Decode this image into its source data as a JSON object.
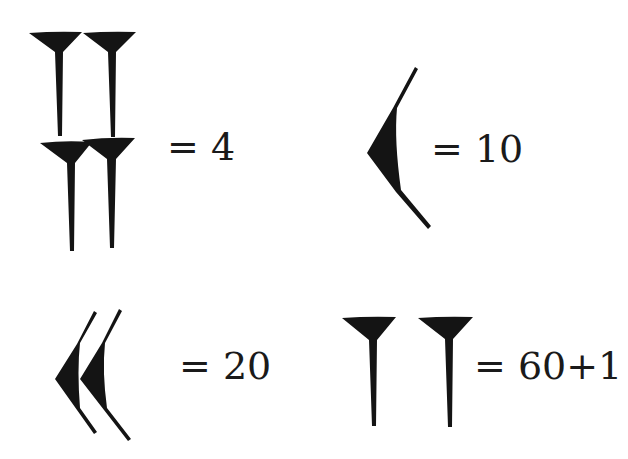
{
  "diagram": {
    "colors": {
      "glyph": "#141414",
      "text": "#1a1a1a",
      "background": "#ffffff"
    },
    "entries": [
      {
        "id": "four",
        "glyph": "four vertical wedges (2 rows of 2)",
        "label": "= 4"
      },
      {
        "id": "ten",
        "glyph": "single corner wedge",
        "label": "= 10"
      },
      {
        "id": "twenty",
        "glyph": "two corner wedges",
        "label": "= 20"
      },
      {
        "id": "sixty-one",
        "glyph": "two spaced vertical wedges",
        "label": "= 60+1"
      }
    ]
  }
}
